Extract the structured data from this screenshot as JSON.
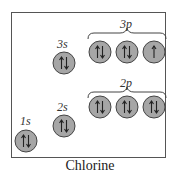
{
  "caption": "Chlorine",
  "colors": {
    "orbital_fill": "#a6a6a6",
    "orbital_stroke": "#444444",
    "border": "#555555"
  },
  "orbitals": [
    {
      "label": "1s",
      "group": "1s",
      "electrons": 2,
      "arrows": "up-down"
    },
    {
      "label": "2s",
      "group": "2s",
      "electrons": 2,
      "arrows": "up-down"
    },
    {
      "label": "2p",
      "group": "2p",
      "boxes": [
        {
          "electrons": 2,
          "arrows": "up-down"
        },
        {
          "electrons": 2,
          "arrows": "up-down"
        },
        {
          "electrons": 2,
          "arrows": "up-down"
        }
      ]
    },
    {
      "label": "3s",
      "group": "3s",
      "electrons": 2,
      "arrows": "up-down"
    },
    {
      "label": "3p",
      "group": "3p",
      "boxes": [
        {
          "electrons": 2,
          "arrows": "up-down"
        },
        {
          "electrons": 2,
          "arrows": "up-down"
        },
        {
          "electrons": 1,
          "arrows": "up"
        }
      ]
    }
  ],
  "labels": {
    "s1": "1s",
    "s2": "2s",
    "s3": "3s",
    "p2": "2p",
    "p3": "3p"
  }
}
